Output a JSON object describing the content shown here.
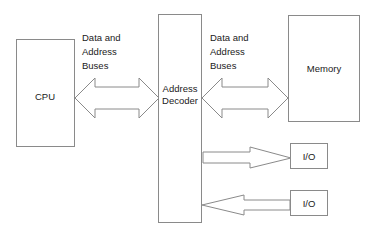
{
  "diagram": {
    "background_color": "#ffffff",
    "line_color": "#8a8a8a",
    "text_color": "#1a1a1a",
    "nodes": {
      "cpu": {
        "label": "CPU"
      },
      "address_decoder": {
        "label_line1": "Address",
        "label_line2": "Decoder"
      },
      "memory": {
        "label": "Memory"
      },
      "io_top": {
        "label": "I/O"
      },
      "io_bottom": {
        "label": "I/O"
      }
    },
    "bus_labels": {
      "left": {
        "line1": "Data and",
        "line2": "Address",
        "line3": "Buses"
      },
      "right": {
        "line1": "Data and",
        "line2": "Address",
        "line3": "Buses"
      }
    },
    "connectors": {
      "cpu_to_decoder": {
        "name": "bidirectional-bus-arrow",
        "direction": "both"
      },
      "decoder_to_memory": {
        "name": "bidirectional-bus-arrow",
        "direction": "both"
      },
      "decoder_to_io_top": {
        "name": "output-arrow",
        "direction": "right"
      },
      "io_bottom_to_decoder": {
        "name": "input-arrow",
        "direction": "left"
      }
    }
  }
}
